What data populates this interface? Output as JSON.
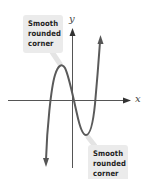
{
  "diagram": {
    "type": "function-graph",
    "axes": {
      "x_label": "x",
      "y_label": "y"
    },
    "callouts": [
      {
        "id": "top",
        "lines": [
          "Smooth",
          "rounded",
          "corner"
        ],
        "points_to": "local-maximum"
      },
      {
        "id": "bottom",
        "lines": [
          "Smooth",
          "rounded",
          "corner"
        ],
        "points_to": "local-minimum"
      }
    ],
    "colors": {
      "curve": "#5a5a5a",
      "axes": "#555555",
      "callout_bg": "#ebebeb",
      "callout_text": "#222222"
    }
  }
}
